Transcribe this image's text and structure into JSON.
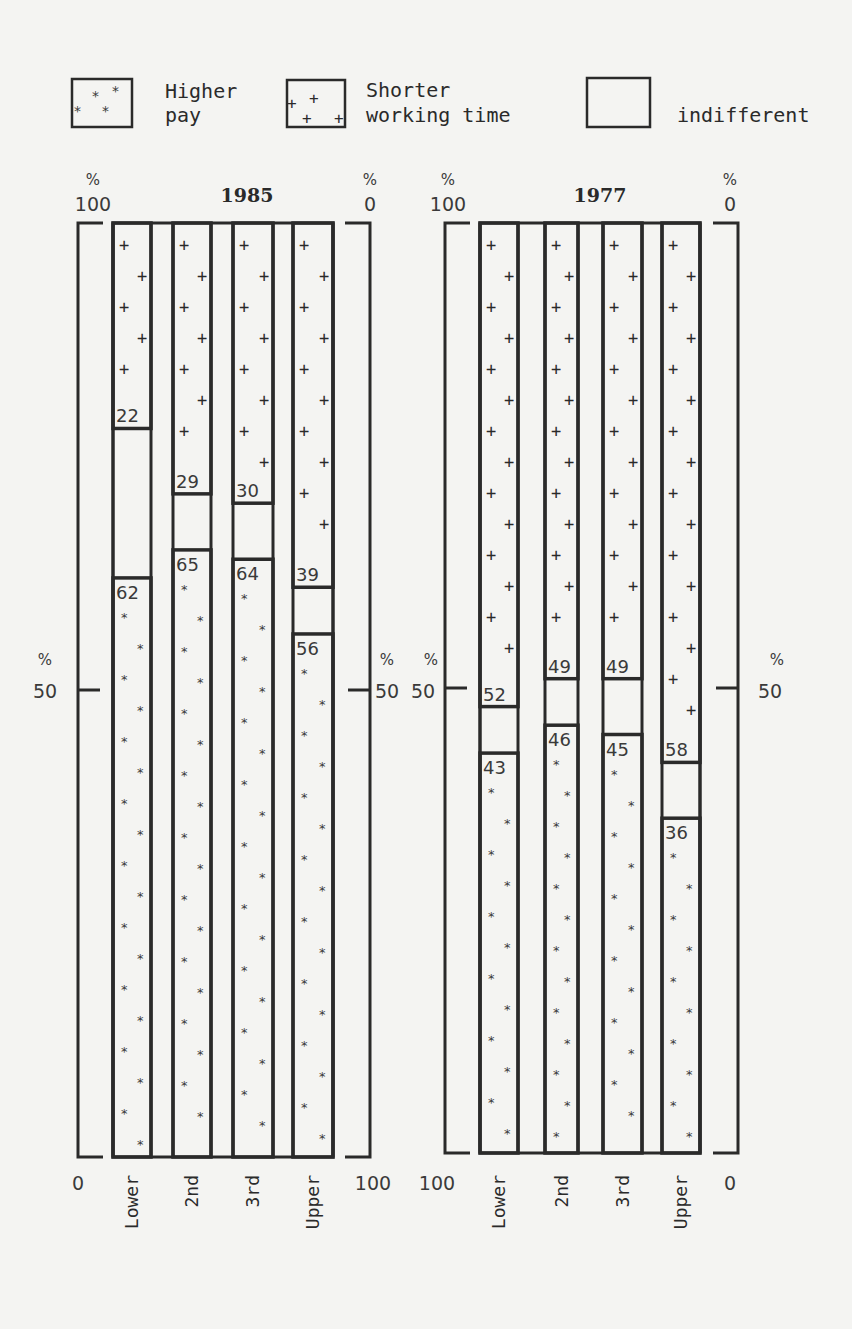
{
  "legend": {
    "items": [
      {
        "key": "higher_pay",
        "line1": "Higher",
        "line2": "pay",
        "pattern": "asterisk"
      },
      {
        "key": "shorter_time",
        "line1": "Shorter",
        "line2": "working time",
        "pattern": "plus"
      },
      {
        "key": "indifferent",
        "line1": "",
        "line2": "indifferent",
        "pattern": "none"
      }
    ]
  },
  "chart_data": [
    {
      "type": "bar",
      "title": "1985",
      "categories": [
        "Lower",
        "2nd",
        "3rd",
        "Upper"
      ],
      "series": [
        {
          "name": "Higher pay",
          "values": [
            62,
            65,
            64,
            56
          ],
          "anchor": "bottom"
        },
        {
          "name": "Shorter working time",
          "values": [
            22,
            29,
            30,
            39
          ],
          "anchor": "top"
        },
        {
          "name": "indifferent",
          "values": [
            16,
            6,
            6,
            5
          ]
        }
      ],
      "left_axis": {
        "unit": "%",
        "top": "100",
        "mid": "50",
        "bottom": "0"
      },
      "right_axis": {
        "unit": "%",
        "top": "0",
        "mid": "50",
        "bottom": "100"
      },
      "ylim": [
        0,
        100
      ],
      "grid": false
    },
    {
      "type": "bar",
      "title": "1977",
      "categories": [
        "Lower",
        "2nd",
        "3rd",
        "Upper"
      ],
      "series": [
        {
          "name": "Higher pay",
          "values": [
            43,
            46,
            45,
            36
          ],
          "anchor": "bottom"
        },
        {
          "name": "Shorter working time",
          "values": [
            52,
            49,
            49,
            58
          ],
          "anchor": "top"
        },
        {
          "name": "indifferent",
          "values": [
            5,
            5,
            6,
            6
          ]
        }
      ],
      "left_axis": {
        "unit": "%",
        "top": "100",
        "mid": "50",
        "bottom": "100"
      },
      "right_axis": {
        "unit": "%",
        "top": "0",
        "mid": "50",
        "bottom": "0"
      },
      "ylim": [
        0,
        100
      ],
      "grid": false
    }
  ]
}
